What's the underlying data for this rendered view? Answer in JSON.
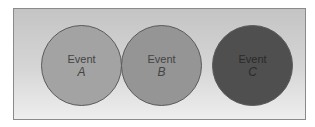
{
  "diagram": {
    "events": [
      {
        "label": "Event",
        "variable": "A",
        "fill": "#a3a3a3",
        "text_color": "#3f3f3f"
      },
      {
        "label": "Event",
        "variable": "B",
        "fill": "#959595",
        "text_color": "#3f3f3f"
      },
      {
        "label": "Event",
        "variable": "C",
        "fill": "#4f4f4f",
        "text_color": "#2a2a2a"
      }
    ]
  }
}
